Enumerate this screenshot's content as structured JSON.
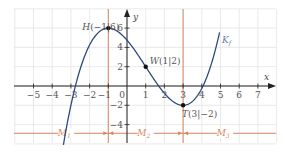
{
  "chart_data": {
    "type": "line",
    "title": "",
    "xlabel": "x",
    "ylabel": "y",
    "xlim": [
      -6,
      8
    ],
    "ylim": [
      -6,
      8
    ],
    "grid": true,
    "x_ticks": [
      -5,
      -4,
      -3,
      -2,
      -1,
      0,
      1,
      2,
      3,
      4,
      5,
      6,
      7
    ],
    "x_tick_labels": [
      "−5",
      "−4",
      "−3",
      "−2",
      "−1",
      "0",
      "1",
      "2",
      "3",
      "4",
      "5",
      "6",
      "7"
    ],
    "y_ticks": [
      6,
      4,
      2,
      -2,
      -4
    ],
    "y_tick_labels": [
      "6",
      "4",
      "2",
      "−2",
      "−4"
    ],
    "function": {
      "name": "K_f",
      "label": "K",
      "label_sub": "f",
      "formula": "f(x) = 0.25x³ − 0.75x² − 2.25x + 4.75",
      "coeffs": [
        0.25,
        -0.75,
        -2.25,
        4.75
      ],
      "x_range": [
        -3.4,
        4.95
      ],
      "color": "#2e4a7d"
    },
    "points": [
      {
        "name": "H",
        "x": -1,
        "y": 6,
        "label": "H(−1|6)",
        "meaning": "high point"
      },
      {
        "name": "W",
        "x": 1,
        "y": 2,
        "label": "W(1|2)",
        "meaning": "inflection point"
      },
      {
        "name": "T",
        "x": 3,
        "y": -2,
        "label": "T(3|−2)",
        "meaning": "low point"
      }
    ],
    "vertical_markers": [
      {
        "x": -1,
        "color": "#d98560"
      },
      {
        "x": 3,
        "color": "#d98560"
      }
    ],
    "intervals": [
      {
        "label": "M",
        "sub": "1",
        "from": -6,
        "to": -1
      },
      {
        "label": "M",
        "sub": "2",
        "from": -1,
        "to": 3
      },
      {
        "label": "M",
        "sub": "3",
        "from": 3,
        "to": 8
      }
    ],
    "interval_line_y": -4.9
  },
  "colors": {
    "axis": "#222222",
    "grid": "#e3e3e3",
    "curve": "#2e4a7d",
    "marker": "#d98560"
  }
}
